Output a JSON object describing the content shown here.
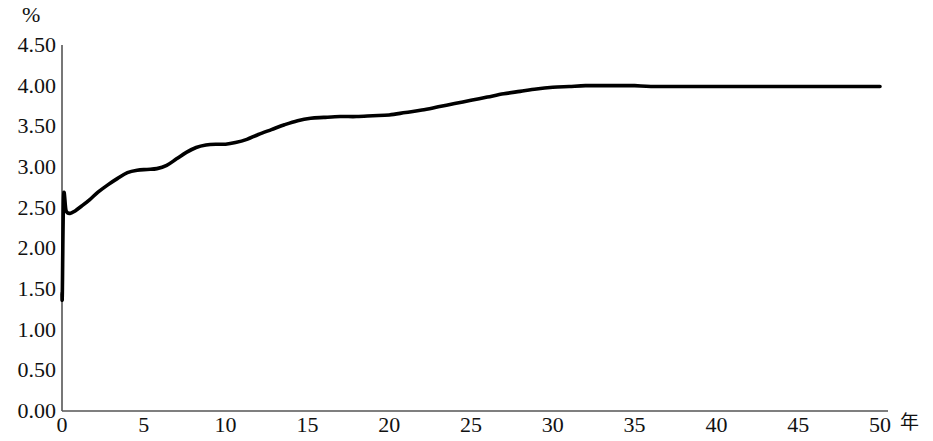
{
  "chart_data": {
    "type": "line",
    "title": "",
    "subtitle": "",
    "xlabel": "年",
    "ylabel": "%",
    "xlim": [
      0,
      50
    ],
    "ylim": [
      0,
      4.5
    ],
    "grid": false,
    "legend": null,
    "x_ticks": [
      "0",
      "5",
      "10",
      "15",
      "20",
      "25",
      "30",
      "35",
      "40",
      "45",
      "50"
    ],
    "y_ticks": [
      "0.00",
      "0.50",
      "1.00",
      "1.50",
      "2.00",
      "2.50",
      "3.00",
      "3.50",
      "4.00",
      "4.50"
    ],
    "line_color": "#000000",
    "axis_color": "#555555",
    "series": [
      {
        "name": "forward rate",
        "x": [
          0.0,
          0.02,
          0.1,
          0.25,
          0.5,
          0.8,
          1.2,
          1.7,
          2.2,
          2.8,
          3.4,
          4.0,
          4.6,
          5.2,
          5.8,
          6.4,
          7.0,
          7.6,
          8.2,
          8.8,
          9.4,
          10.0,
          10.6,
          11.3,
          12.0,
          12.8,
          13.6,
          14.4,
          15.2,
          16.0,
          17.0,
          18.0,
          19.0,
          20.0,
          21.0,
          22.0,
          23.0,
          24.0,
          25.0,
          26.0,
          27.0,
          28.0,
          29.0,
          30.0,
          31.0,
          32.0,
          33.0,
          34.0,
          35.0,
          36.0,
          38.0,
          40.0,
          42.0,
          44.0,
          46.0,
          48.0,
          50.0
        ],
        "y": [
          1.45,
          1.45,
          2.64,
          2.46,
          2.43,
          2.46,
          2.52,
          2.6,
          2.69,
          2.78,
          2.86,
          2.93,
          2.96,
          2.97,
          2.98,
          3.02,
          3.1,
          3.18,
          3.24,
          3.27,
          3.28,
          3.28,
          3.3,
          3.34,
          3.4,
          3.46,
          3.52,
          3.57,
          3.6,
          3.61,
          3.62,
          3.62,
          3.63,
          3.64,
          3.67,
          3.7,
          3.74,
          3.78,
          3.82,
          3.86,
          3.9,
          3.93,
          3.96,
          3.98,
          3.99,
          4.0,
          4.0,
          4.0,
          4.0,
          3.99,
          3.99,
          3.99,
          3.99,
          3.99,
          3.99,
          3.99,
          3.99
        ]
      }
    ],
    "annotations": []
  }
}
